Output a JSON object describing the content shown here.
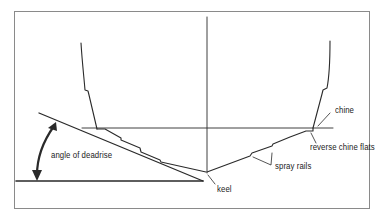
{
  "diagram": {
    "labels": {
      "chine": "chine",
      "reverse_chine_flats": "reverse chine flats",
      "spray_rails": "spray rails",
      "keel": "keel",
      "angle_of_deadrise": "angle of deadrise"
    },
    "colors": {
      "line": "#2a2a2a",
      "frame": "#8a8a8a",
      "background": "#ffffff"
    }
  }
}
